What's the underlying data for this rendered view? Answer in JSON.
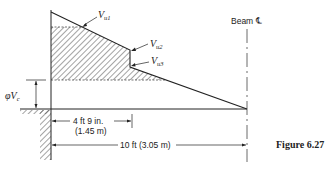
{
  "figure": {
    "caption": "Figure 6.27",
    "labels": {
      "vu1": {
        "main": "V",
        "sub": "u1"
      },
      "vu2": {
        "main": "V",
        "sub": "u2"
      },
      "vu3": {
        "main": "V",
        "sub": "u3"
      },
      "phi_vc": {
        "main": "φV",
        "sub": "c"
      },
      "beam_cl": "Beam ℄"
    },
    "dimensions": {
      "critical_section": {
        "line1": "4 ft 9 in.",
        "line2": "(1.45 m)"
      },
      "span_to_cl": "10 ft (3.05 m)"
    },
    "colors": {
      "ink": "#222222",
      "background": "#ffffff"
    }
  }
}
